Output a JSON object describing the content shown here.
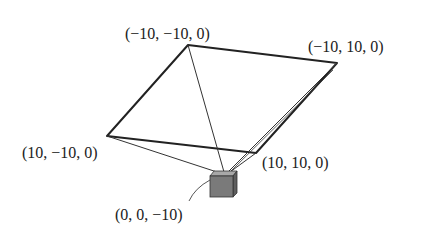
{
  "diagram": {
    "vertices": {
      "top": "(−10, −10, 0)",
      "right": "(−10, 10, 0)",
      "left": "(10, −10, 0)",
      "bottom": "(10, 10, 0)"
    },
    "camera_label": "(0, 0, −10)",
    "colors": {
      "stroke": "#222222",
      "cube_front": "#7a7a7a",
      "cube_side": "#5e5e5e",
      "cube_top": "#a8a8a8"
    }
  }
}
